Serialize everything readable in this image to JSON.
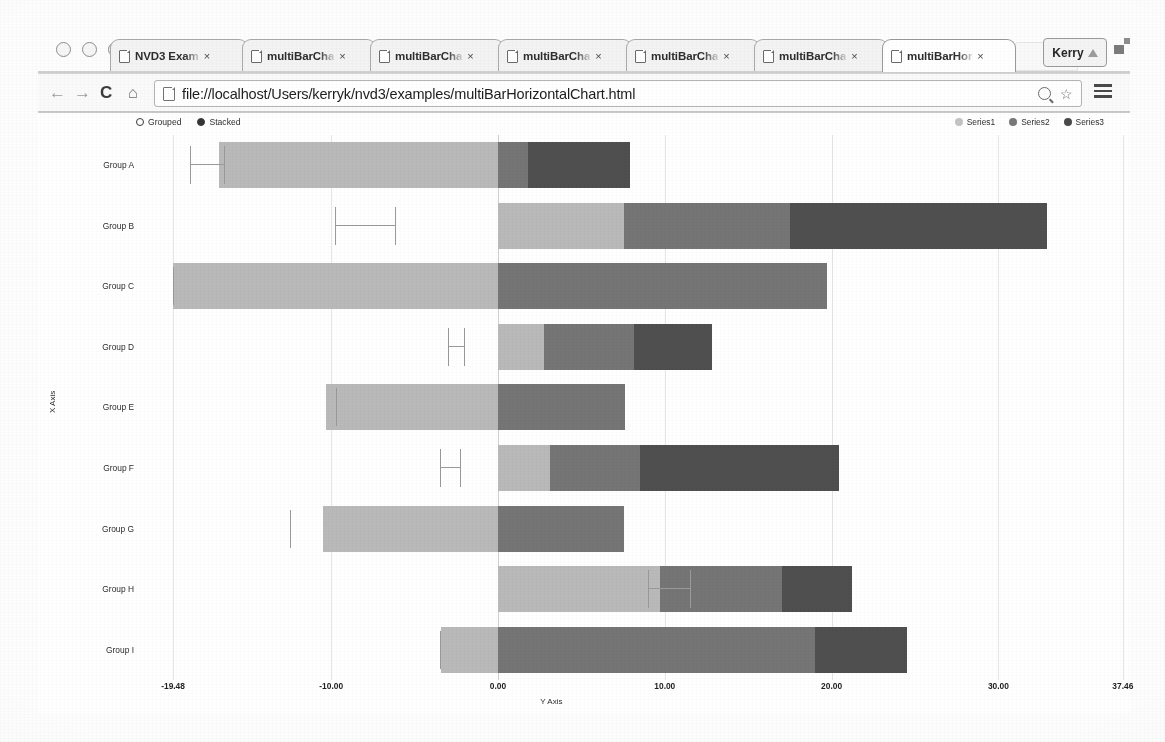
{
  "browser": {
    "window_buttons": [
      "close",
      "minimize",
      "maximize"
    ],
    "tabs": [
      {
        "label": "NVD3 Exam",
        "close": "×",
        "active": false
      },
      {
        "label": "multiBarCha",
        "close": "×",
        "active": false
      },
      {
        "label": "multiBarCha",
        "close": "×",
        "active": false
      },
      {
        "label": "multiBarCha",
        "close": "×",
        "active": false
      },
      {
        "label": "multiBarCha",
        "close": "×",
        "active": false
      },
      {
        "label": "multiBarCha",
        "close": "×",
        "active": false
      },
      {
        "label": "multiBarHor",
        "close": "×",
        "active": true
      }
    ],
    "profile_name": "Kerry",
    "nav": {
      "back": "←",
      "forward": "→",
      "reload": "C",
      "home": "⌂"
    },
    "url": "file://localhost/Users/kerryk/nvd3/examples/multiBarHorizontalChart.html",
    "omnibox_icons": [
      "zoom-icon",
      "bookmark-star-icon"
    ],
    "menu_icon": "hamburger-menu-icon"
  },
  "chart_controls": [
    {
      "label": "Grouped",
      "selected": false
    },
    {
      "label": "Stacked",
      "selected": true
    }
  ],
  "chart_data": {
    "type": "bar",
    "orientation": "horizontal",
    "stacked": true,
    "title": "",
    "xlabel": "Y Axis",
    "ylabel": "X Axis",
    "categories": [
      "Group A",
      "Group B",
      "Group C",
      "Group D",
      "Group E",
      "Group F",
      "Group G",
      "Group H",
      "Group I"
    ],
    "axis_ticks": [
      "-19.48",
      "-10.00",
      "0.00",
      "10.00",
      "20.00",
      "30.00",
      "37.46"
    ],
    "axis_tick_values": [
      -19.48,
      -10.0,
      0.0,
      10.0,
      20.0,
      30.0,
      37.46
    ],
    "xlim": [
      -19.48,
      37.46
    ],
    "grid": true,
    "legend_position": "top-right",
    "colors": {
      "series1": "#b9b9b9",
      "series2": "#757575",
      "series3": "#4f4f4f"
    },
    "series": [
      {
        "name": "Series1",
        "color": "#b9b9b9",
        "values": [
          -16.7,
          7.58,
          -19.48,
          2.77,
          -10.3,
          3.11,
          -10.48,
          9.73,
          -3.41
        ]
      },
      {
        "name": "Series2",
        "color": "#757575",
        "values": [
          1.8,
          9.95,
          19.74,
          5.39,
          7.59,
          5.39,
          7.57,
          7.31,
          18.98
        ]
      },
      {
        "name": "Series3",
        "color": "#4f4f4f",
        "values": [
          6.1,
          15.4,
          0.0,
          4.66,
          0.0,
          11.95,
          0.0,
          4.19,
          5.53
        ]
      }
    ],
    "error_bars": [
      {
        "group": "Group A",
        "low": -18.45,
        "high": -16.45
      },
      {
        "group": "Group B",
        "low": -9.8,
        "high": -6.2
      },
      {
        "group": "Group C",
        "low": -19.48,
        "high": -19.48
      },
      {
        "group": "Group D",
        "low": -3.0,
        "high": -2.05
      },
      {
        "group": "Group E",
        "low": -9.7,
        "high": -9.7
      },
      {
        "group": "Group F",
        "low": -3.45,
        "high": -2.3
      },
      {
        "group": "Group G",
        "low": -12.45,
        "high": -12.45
      },
      {
        "group": "Group H",
        "low": 9.0,
        "high": 11.5
      },
      {
        "group": "Group I",
        "low": -3.45,
        "high": -3.45
      }
    ]
  },
  "legend": [
    {
      "label": "Series1",
      "color": "#c4c4c4"
    },
    {
      "label": "Series2",
      "color": "#787878"
    },
    {
      "label": "Series3",
      "color": "#4a4a4a"
    }
  ]
}
